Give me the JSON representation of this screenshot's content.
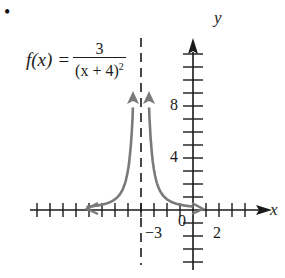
{
  "bullet": "•",
  "formula": {
    "lhs": "f(x)",
    "eq": "=",
    "numerator": "3",
    "denominator_base": "(x + 4)",
    "denominator_exp": "2"
  },
  "colors": {
    "axis": "#1a1a1a",
    "curve": "#7a7a7a",
    "asymptote": "#1a1a1a"
  },
  "chart_data": {
    "type": "line",
    "xlabel": "x",
    "ylabel": "y",
    "function": "3/(x+4)^2",
    "vertical_asymptote": -4,
    "horizontal_asymptote": 0,
    "x_tick_labels": [
      "-3",
      "0",
      "2"
    ],
    "y_tick_labels": [
      "4",
      "8"
    ],
    "xlim": [
      -12,
      4
    ],
    "ylim": [
      -4,
      12
    ],
    "grid": false,
    "series": [
      {
        "name": "left branch",
        "x": [
          -11,
          -8,
          -6,
          -5,
          -4.6,
          -4.55
        ],
        "y": [
          0.06,
          0.19,
          0.75,
          3,
          8.3,
          9.9
        ]
      },
      {
        "name": "right branch",
        "x": [
          -3.45,
          -3.4,
          -3,
          -2,
          0,
          1
        ],
        "y": [
          9.9,
          8.3,
          3,
          0.75,
          0.19,
          0.12
        ]
      }
    ]
  },
  "labels": {
    "y_axis": "y",
    "x_axis": "x",
    "tick_neg3": "−3",
    "tick_0": "0",
    "tick_2": "2",
    "tick_4": "4",
    "tick_8": "8"
  }
}
